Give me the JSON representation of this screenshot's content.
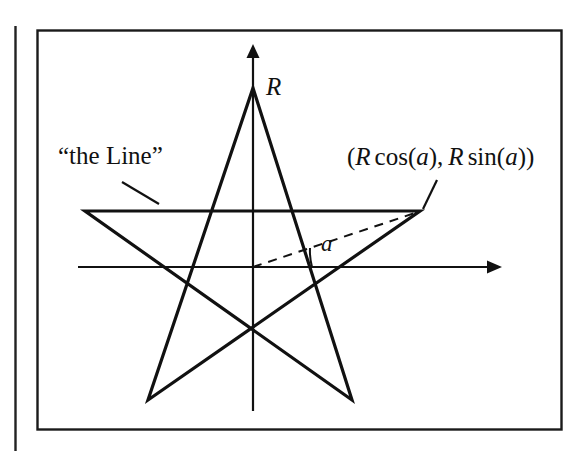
{
  "figure": {
    "kind": "geometry-diagram",
    "background_color": "#ffffff",
    "ink_color": "#111111",
    "border_color": "#1a1a1a"
  },
  "labels": {
    "the_line": "“the Line”",
    "radius": "R",
    "angle": "a",
    "point_coords": {
      "open_paren": "(",
      "r_first": "R",
      "cos_name": "cos",
      "cos_open": "(",
      "cos_arg": "a",
      "cos_close": ")",
      "comma": ",",
      "r_second": "R",
      "sin_name": "sin",
      "sin_open": "(",
      "sin_arg": "a",
      "sin_close": ")",
      "close_paren": ")",
      "full_text": "(R cos(a), R sin(a))"
    }
  },
  "geometry": {
    "page_rule_x": 15,
    "frame": {
      "x": 37,
      "y": 30,
      "width": 525,
      "height": 400
    },
    "origin": {
      "x": 253,
      "y": 267
    },
    "x_axis": {
      "x1": 78,
      "y1": 267,
      "x2": 497,
      "y2": 267,
      "arrow": "right"
    },
    "y_axis": {
      "x1": 253,
      "y1": 410,
      "x2": 253,
      "y2": 48,
      "arrow": "up"
    },
    "star_vertices": [
      {
        "name": "top",
        "x": 253,
        "y": 88
      },
      {
        "name": "right",
        "x": 420,
        "y": 211
      },
      {
        "name": "bottom-right",
        "x": 352,
        "y": 400
      },
      {
        "name": "bottom-left",
        "x": 148,
        "y": 400
      },
      {
        "name": "left",
        "x": 85,
        "y": 211
      }
    ],
    "dashed_radius": {
      "x1": 253,
      "y1": 267,
      "x2": 418,
      "y2": 212
    },
    "angle_arc": {
      "cx": 253,
      "cy": 267,
      "radius": 85
    },
    "leader_the_line": {
      "x1": 122,
      "y1": 182,
      "x2": 159,
      "y2": 204
    },
    "leader_point_coords": {
      "x1": 437,
      "y1": 180,
      "x2": 423,
      "y2": 209
    }
  }
}
